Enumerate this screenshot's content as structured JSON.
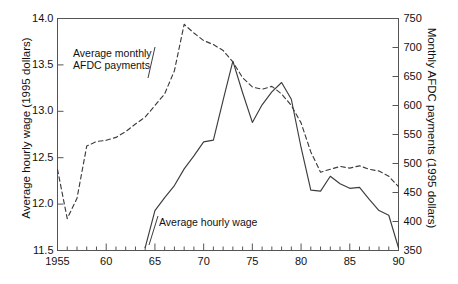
{
  "title": "",
  "axes": {
    "left": {
      "label": "Average hourly wage (1995 dollars)",
      "ticks": [
        "11.5",
        "12.0",
        "12.5",
        "13.0",
        "13.5",
        "14.0"
      ],
      "min": 11.5,
      "max": 14.0
    },
    "right": {
      "label": "Monthly AFDC payments (1995 dollars)",
      "ticks": [
        "350",
        "400",
        "450",
        "500",
        "550",
        "600",
        "650",
        "700",
        "750"
      ],
      "min": 350,
      "max": 750
    },
    "bottom": {
      "label": "",
      "ticks": [
        "1955",
        "60",
        "65",
        "70",
        "75",
        "80",
        "85",
        "90"
      ],
      "min": 1955,
      "max": 1990
    }
  },
  "annotations": {
    "afdc": "Average monthly\nAFDC payments",
    "wage": "Average hourly wage"
  },
  "colors": {
    "line": "#3c3c3c",
    "axis": "#555555",
    "text": "#111111"
  },
  "chart_data": {
    "type": "line",
    "title": "",
    "xlabel": "",
    "ylabel": "Average hourly wage (1995 dollars)",
    "y2label": "Monthly AFDC payments (1995 dollars)",
    "xlim": [
      1955,
      1990
    ],
    "ylim": [
      11.5,
      14.0
    ],
    "y2lim": [
      350,
      750
    ],
    "grid": false,
    "legend": "annotations-inline",
    "series": [
      {
        "name": "Average monthly AFDC payments",
        "axis": "right",
        "style": "dashed",
        "units": "1995 dollars per month",
        "x": [
          1955,
          1956,
          1957,
          1958,
          1959,
          1960,
          1961,
          1962,
          1963,
          1964,
          1965,
          1966,
          1967,
          1968,
          1969,
          1970,
          1971,
          1972,
          1973,
          1974,
          1975,
          1976,
          1977,
          1978,
          1979,
          1980,
          1981,
          1982,
          1983,
          1984,
          1985,
          1986,
          1987,
          1988,
          1989,
          1990
        ],
        "values": [
          490,
          405,
          440,
          530,
          538,
          540,
          545,
          555,
          568,
          580,
          600,
          620,
          660,
          740,
          725,
          712,
          705,
          695,
          675,
          648,
          632,
          628,
          633,
          620,
          600,
          570,
          520,
          485,
          490,
          495,
          492,
          496,
          490,
          487,
          478,
          460
        ]
      },
      {
        "name": "Average hourly wage",
        "axis": "left",
        "style": "solid",
        "units": "1995 dollars per hour",
        "x": [
          1964,
          1965,
          1966,
          1967,
          1968,
          1969,
          1970,
          1971,
          1972,
          1973,
          1974,
          1975,
          1976,
          1977,
          1978,
          1979,
          1980,
          1981,
          1982,
          1983,
          1984,
          1985,
          1986,
          1987,
          1988,
          1989,
          1990
        ],
        "values": [
          11.53,
          11.93,
          12.07,
          12.2,
          12.38,
          12.52,
          12.67,
          12.69,
          13.12,
          13.54,
          13.2,
          12.88,
          13.07,
          13.21,
          13.31,
          13.13,
          12.61,
          12.15,
          12.14,
          12.3,
          12.22,
          12.17,
          12.18,
          12.05,
          11.93,
          11.88,
          11.53
        ]
      }
    ]
  }
}
